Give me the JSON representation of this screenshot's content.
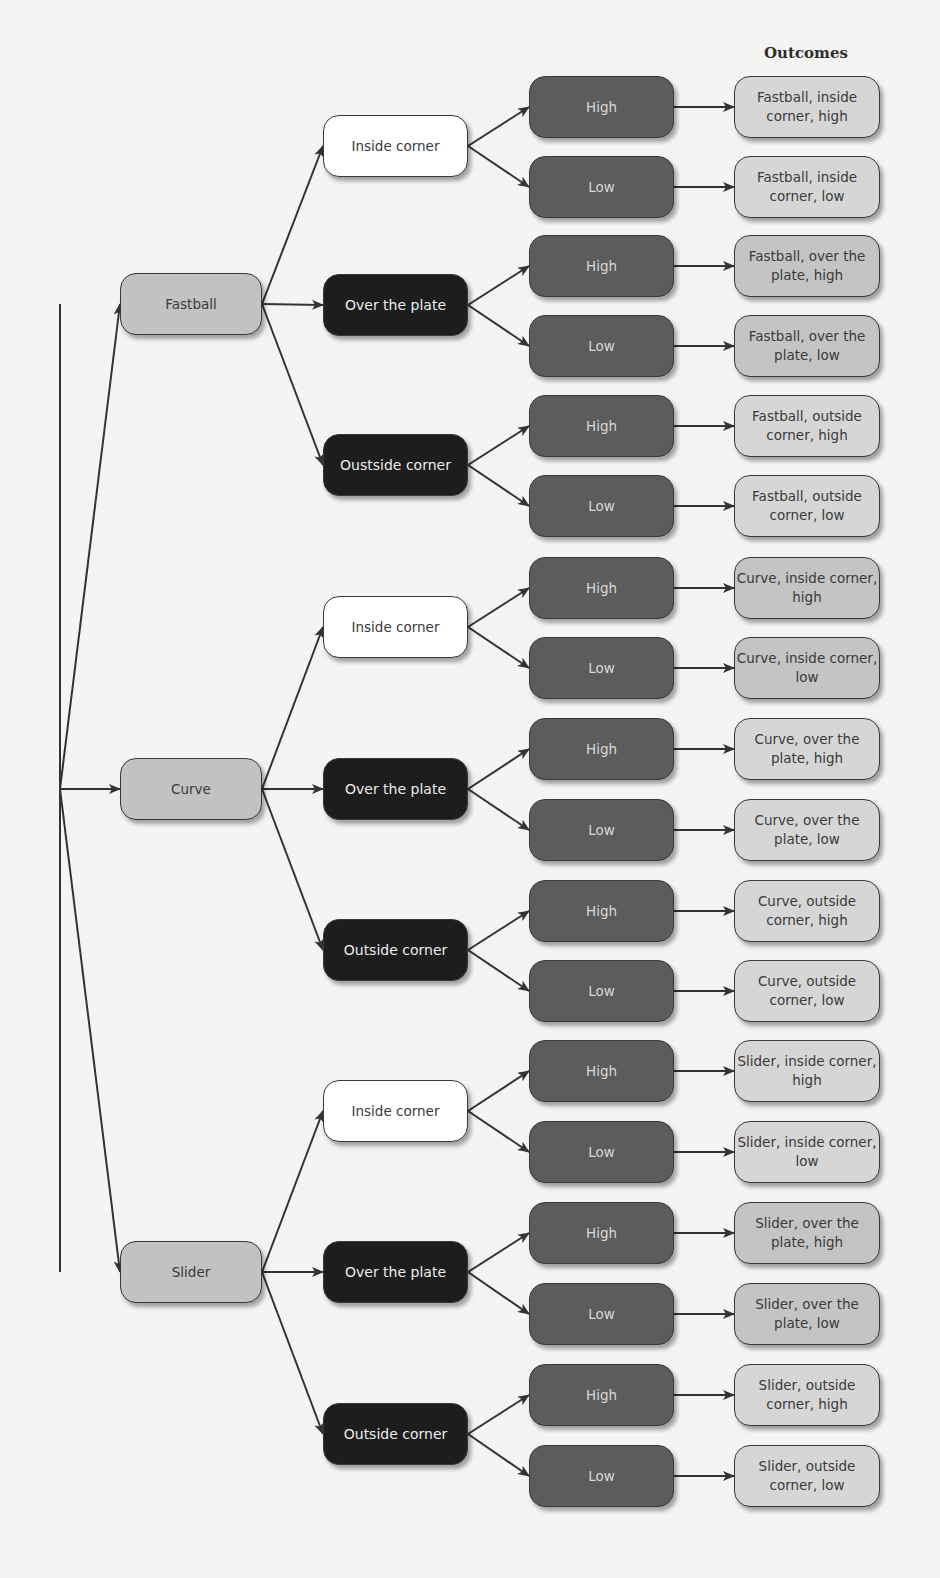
{
  "heading": "Outcomes",
  "colors": {
    "pitch_fill": "#c2c2c2",
    "location_inside_fill": "#ffffff",
    "location_dark_fill": "#1d1d1d",
    "height_fill": "#5c5c5c",
    "outcome_fill_light": "#d6d6d6",
    "outcome_fill_mid": "#c4c4c4",
    "edge_color": "#333333"
  },
  "tree": {
    "root": {
      "x": 60,
      "y": 789
    },
    "pitches": [
      {
        "label": "Fastball",
        "y": 304,
        "locations": [
          {
            "label": "Inside corner",
            "style": "white",
            "y": 146,
            "heights": [
              {
                "label": "High",
                "y": 107,
                "outcome": "Fastball, inside corner, high",
                "shade": "light"
              },
              {
                "label": "Low",
                "y": 187,
                "outcome": "Fastball, inside corner, low",
                "shade": "light"
              }
            ]
          },
          {
            "label": "Over the plate",
            "style": "dark",
            "y": 305,
            "heights": [
              {
                "label": "High",
                "y": 266,
                "outcome": "Fastball, over the plate, high",
                "shade": "mid"
              },
              {
                "label": "Low",
                "y": 346,
                "outcome": "Fastball, over the plate, low",
                "shade": "mid"
              }
            ]
          },
          {
            "label": "Oustside corner",
            "style": "dark",
            "y": 465,
            "heights": [
              {
                "label": "High",
                "y": 426,
                "outcome": "Fastball, outside corner, high",
                "shade": "light"
              },
              {
                "label": "Low",
                "y": 506,
                "outcome": "Fastball, outside corner, low",
                "shade": "light"
              }
            ]
          }
        ]
      },
      {
        "label": "Curve",
        "y": 789,
        "locations": [
          {
            "label": "Inside corner",
            "style": "white",
            "y": 627,
            "heights": [
              {
                "label": "High",
                "y": 588,
                "outcome": "Curve, inside corner, high",
                "shade": "mid"
              },
              {
                "label": "Low",
                "y": 668,
                "outcome": "Curve, inside corner, low",
                "shade": "mid"
              }
            ]
          },
          {
            "label": "Over the plate",
            "style": "dark",
            "y": 789,
            "heights": [
              {
                "label": "High",
                "y": 749,
                "outcome": "Curve, over the plate, high",
                "shade": "light"
              },
              {
                "label": "Low",
                "y": 830,
                "outcome": "Curve, over the plate, low",
                "shade": "light"
              }
            ]
          },
          {
            "label": "Outside corner",
            "style": "dark",
            "y": 950,
            "heights": [
              {
                "label": "High",
                "y": 911,
                "outcome": "Curve, outside corner, high",
                "shade": "light"
              },
              {
                "label": "Low",
                "y": 991,
                "outcome": "Curve, outside corner, low",
                "shade": "light"
              }
            ]
          }
        ]
      },
      {
        "label": "Slider",
        "y": 1272,
        "locations": [
          {
            "label": "Inside corner",
            "style": "white",
            "y": 1111,
            "heights": [
              {
                "label": "High",
                "y": 1071,
                "outcome": "Slider, inside corner, high",
                "shade": "light"
              },
              {
                "label": "Low",
                "y": 1152,
                "outcome": "Slider, inside corner, low",
                "shade": "light"
              }
            ]
          },
          {
            "label": "Over the plate",
            "style": "dark",
            "y": 1272,
            "heights": [
              {
                "label": "High",
                "y": 1233,
                "outcome": "Slider, over the plate, high",
                "shade": "mid"
              },
              {
                "label": "Low",
                "y": 1314,
                "outcome": "Slider, over the plate, low",
                "shade": "mid"
              }
            ]
          },
          {
            "label": "Outside corner",
            "style": "dark",
            "y": 1434,
            "heights": [
              {
                "label": "High",
                "y": 1395,
                "outcome": "Slider, outside corner, high",
                "shade": "light"
              },
              {
                "label": "Low",
                "y": 1476,
                "outcome": "Slider, outside corner, low",
                "shade": "light"
              }
            ]
          }
        ]
      }
    ]
  }
}
